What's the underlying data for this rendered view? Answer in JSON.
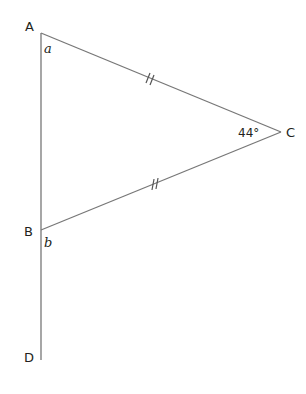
{
  "diagram": {
    "type": "geometry",
    "points": {
      "A": {
        "label": "A",
        "x": 41,
        "y": 33
      },
      "B": {
        "label": "B",
        "x": 41,
        "y": 230
      },
      "C": {
        "label": "C",
        "x": 281,
        "y": 132
      },
      "D": {
        "label": "D",
        "x": 41,
        "y": 360
      }
    },
    "angle_labels": {
      "a": "a",
      "b": "b",
      "C": "44°"
    },
    "equal_marks": [
      "AC",
      "BC"
    ],
    "line_color": "#777777",
    "text_color": "#231f20"
  }
}
